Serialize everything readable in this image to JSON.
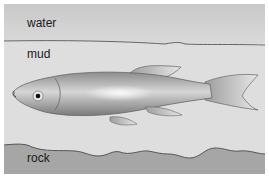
{
  "labels": {
    "water": "water",
    "mud": "mud",
    "rock": "rock"
  },
  "colors": {
    "water": "#d4d4d4",
    "mud": "#dcdcdc",
    "rock": "#a4a4a4",
    "fish_body": "#9a9a9a",
    "outline": "#555555"
  }
}
